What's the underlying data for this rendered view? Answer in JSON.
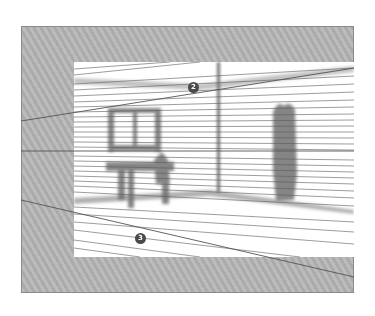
{
  "figure": {
    "colors": {
      "frame_fill": "#b4b4b4",
      "canvas_fill": "#ffffff",
      "line": "#555555",
      "shading": "#6e6e6e",
      "badge": "#4a4a4a"
    },
    "callouts": [
      {
        "label": "2",
        "x": 193,
        "y": 87
      },
      {
        "label": "3",
        "x": 140,
        "y": 238
      }
    ],
    "objects": [
      "window",
      "table",
      "chair",
      "wall-corner-post",
      "coat-shadow",
      "floor",
      "ceiling"
    ]
  }
}
